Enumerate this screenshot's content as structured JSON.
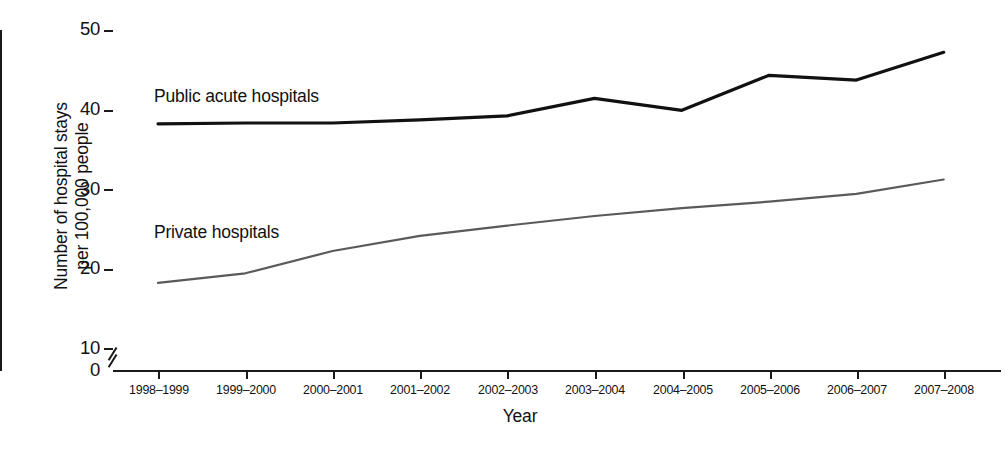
{
  "chart_data": {
    "type": "line",
    "title": "",
    "xlabel": "Year",
    "ylabel": "Number of hospital stays per 100,000 people",
    "ylabel_line1": "Number of hospital stays",
    "ylabel_line2": "per 100,000 people",
    "categories": [
      "1998–1999",
      "1999–2000",
      "2000–2001",
      "2001–2002",
      "2002–2003",
      "2003–2004",
      "2004–2005",
      "2005–2006",
      "2006–2007",
      "2007–2008"
    ],
    "yticks": [
      "0",
      "10",
      "20",
      "30",
      "40",
      "50"
    ],
    "ylim": [
      10,
      50
    ],
    "y_axis_break": true,
    "grid": false,
    "legend_position": "inline-labels",
    "series": [
      {
        "name": "Public acute hospitals",
        "color": "#111111",
        "line_width": 3.2,
        "values": [
          38.2,
          38.3,
          38.3,
          38.7,
          39.2,
          41.4,
          39.9,
          44.3,
          43.7,
          47.2
        ]
      },
      {
        "name": "Private hospitals",
        "color": "#5a5a5a",
        "line_width": 2.2,
        "values": [
          18.2,
          19.4,
          22.2,
          24.1,
          25.4,
          26.6,
          27.6,
          28.4,
          29.4,
          31.2
        ]
      }
    ],
    "annotations": [
      {
        "text": "Public acute hospitals",
        "series": "Public acute hospitals"
      },
      {
        "text": "Private hospitals",
        "series": "Private hospitals"
      }
    ]
  },
  "axis": {
    "x_title": "Year",
    "y_title_line1": "Number of hospital stays",
    "y_title_line2": "per 100,000 people"
  },
  "ytick_labels": {
    "t0": "0",
    "t10": "10",
    "t20": "20",
    "t30": "30",
    "t40": "40",
    "t50": "50"
  },
  "xtick_labels": {
    "x0": "1998–1999",
    "x1": "1999–2000",
    "x2": "2000–2001",
    "x3": "2001–2002",
    "x4": "2002–2003",
    "x5": "2003–2004",
    "x6": "2004–2005",
    "x7": "2005–2006",
    "x8": "2006–2007",
    "x9": "2007–2008"
  },
  "series_labels": {
    "public": "Public acute hospitals",
    "private": "Private hospitals"
  },
  "colors": {
    "public_line": "#111111",
    "private_line": "#5a5a5a",
    "axis": "#1a1a1a",
    "background": "#ffffff"
  }
}
